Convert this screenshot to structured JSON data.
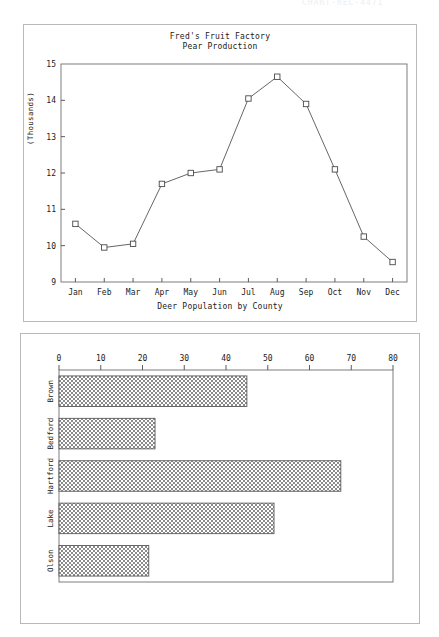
{
  "page": {
    "faint_header_text": "CHART-REC-4471"
  },
  "line_panel": {
    "title": "Fred's Fruit Factory",
    "subtitle": "Pear Production",
    "bottom_caption": "Deer Population by County",
    "y_axis_label": "(Thousands)"
  },
  "bar_panel": {
    "title": ""
  },
  "chart_data": [
    {
      "type": "line",
      "title": "Fred's Fruit Factory",
      "subtitle": "Pear Production",
      "xlabel": "",
      "ylabel": "(Thousands)",
      "categories": [
        "Jan",
        "Feb",
        "Mar",
        "Apr",
        "May",
        "Jun",
        "Jul",
        "Aug",
        "Sep",
        "Oct",
        "Nov",
        "Dec"
      ],
      "values": [
        10.6,
        9.95,
        10.05,
        11.7,
        12.0,
        12.1,
        14.05,
        14.65,
        13.9,
        12.1,
        10.25,
        9.55
      ],
      "ylim": [
        9,
        15
      ],
      "yticks": [
        9,
        10,
        11,
        12,
        13,
        14,
        15
      ],
      "grid": false,
      "legend": "none",
      "marker": "open-square"
    },
    {
      "type": "bar",
      "orientation": "horizontal",
      "title": "Deer Population by County",
      "xlabel": "",
      "ylabel": "",
      "categories": [
        "Brown",
        "Bedford",
        "Hartford",
        "Lake",
        "Olson"
      ],
      "values": [
        45,
        23,
        67.5,
        51.5,
        21.5
      ],
      "xlim": [
        0,
        80
      ],
      "xticks": [
        0,
        10,
        20,
        30,
        40,
        50,
        60,
        70,
        80
      ],
      "grid": false,
      "legend": "none",
      "fill": "checkered-hatch"
    }
  ]
}
